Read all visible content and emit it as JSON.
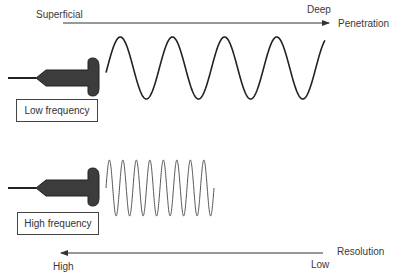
{
  "top_axis": {
    "left_label": "Superficial",
    "right_label": "Deep",
    "name": "Penetration",
    "direction": "left-to-right"
  },
  "bottom_axis": {
    "left_label": "High",
    "right_label": "Low",
    "name": "Resolution",
    "direction": "right-to-left"
  },
  "probes": [
    {
      "label": "Low frequency",
      "wave_cycles": 4.2,
      "relative_frequency": "low"
    },
    {
      "label": "High frequency",
      "wave_cycles": 8,
      "relative_frequency": "high"
    }
  ],
  "colors": {
    "probe_fill": "#3c3c3c",
    "line": "#333333",
    "text": "#3a3a3a"
  }
}
